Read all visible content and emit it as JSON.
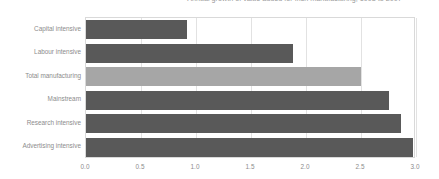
{
  "chart_data": {
    "type": "bar",
    "orientation": "horizontal",
    "title": "Annual growth of value added for Irish manufacturing, 1998 to 2007",
    "xlabel": "",
    "ylabel": "",
    "categories": [
      "Capital intensive",
      "Labour intensive",
      "Total manufacturing",
      "Mainstream",
      "Research intensive",
      "Advertising intensive"
    ],
    "values": [
      0.92,
      1.88,
      2.5,
      2.75,
      2.86,
      2.97
    ],
    "xlim": [
      0.0,
      3.0
    ],
    "xticks": [
      "0.0",
      "0.5",
      "1.0",
      "1.5",
      "2.0",
      "2.5",
      "3.0"
    ],
    "xtick_values": [
      0.0,
      0.5,
      1.0,
      1.5,
      2.0,
      2.5,
      3.0
    ],
    "grid": "vertical",
    "legend": "none",
    "bar_colors": [
      "#595959",
      "#595959",
      "#a6a6a6",
      "#595959",
      "#595959",
      "#595959"
    ],
    "colors": {
      "bar_dark": "#595959",
      "bar_light": "#a6a6a6",
      "gridline": "#e2e2e2",
      "frame": "#d9d9d9",
      "text": "#8c8c8c",
      "title_text": "#9a9a9a",
      "background": "#ffffff"
    }
  }
}
